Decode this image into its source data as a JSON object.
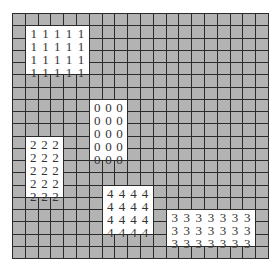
{
  "grid": {
    "rows": 20,
    "cols": 20,
    "background_color": "#b3b3b3",
    "line_color": "#2b2b2b",
    "block_color": "#ffffff"
  },
  "blocks": [
    {
      "label": "1",
      "row": 1,
      "col": 1,
      "rows": 4,
      "cols": 5
    },
    {
      "label": "0",
      "row": 7,
      "col": 6,
      "rows": 5,
      "cols": 3
    },
    {
      "label": "2",
      "row": 10,
      "col": 1,
      "rows": 5,
      "cols": 3
    },
    {
      "label": "4",
      "row": 14,
      "col": 7,
      "rows": 4,
      "cols": 4
    },
    {
      "label": "3",
      "row": 16,
      "col": 12,
      "rows": 3,
      "cols": 7
    }
  ]
}
